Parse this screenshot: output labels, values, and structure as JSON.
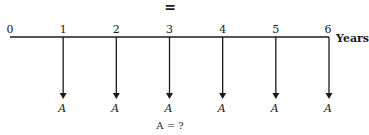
{
  "diagram": {
    "top_symbol": "=",
    "unit_label": "Years",
    "periods": [
      "0",
      "1",
      "2",
      "3",
      "4",
      "5",
      "6"
    ],
    "payment_label": "A",
    "payment_periods": [
      1,
      2,
      3,
      4,
      5,
      6
    ],
    "payment_direction": "down",
    "question": "A = ?",
    "line_color": "#1a1a1a"
  }
}
